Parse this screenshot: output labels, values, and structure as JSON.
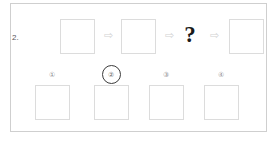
{
  "panel": {
    "item_number": "2.",
    "question_mark": "?",
    "arrow_glyph": "⇨"
  },
  "sequence": {
    "cells": [
      {
        "kind": "tile",
        "label": "sequence-tile-1",
        "left": 49
      },
      {
        "kind": "arrow",
        "label": "sequence-arrow-1",
        "left": 90
      },
      {
        "kind": "tile",
        "label": "sequence-tile-2",
        "left": 110
      },
      {
        "kind": "arrow",
        "label": "sequence-arrow-2",
        "left": 151
      },
      {
        "kind": "question",
        "label": "sequence-question",
        "left": 171
      },
      {
        "kind": "arrow",
        "label": "sequence-arrow-3",
        "left": 196
      },
      {
        "kind": "tile",
        "label": "sequence-tile-3",
        "left": 218
      }
    ]
  },
  "options": [
    {
      "number": "①",
      "plain": "1",
      "selected": false,
      "left": 21
    },
    {
      "number": "②",
      "plain": "2",
      "selected": true,
      "left": 80
    },
    {
      "number": "③",
      "plain": "3",
      "selected": false,
      "left": 135
    },
    {
      "number": "④",
      "plain": "4",
      "selected": false,
      "left": 190
    }
  ],
  "colors": {
    "panel_border": "#cfcfcf",
    "tile_border": "#dcdcdc",
    "arrow": "#d2d2d2",
    "selection_ring": "#3c3c3c",
    "question_mark": "#1a1a1a",
    "label_text": "#8d8d8f",
    "background": "#ffffff"
  }
}
